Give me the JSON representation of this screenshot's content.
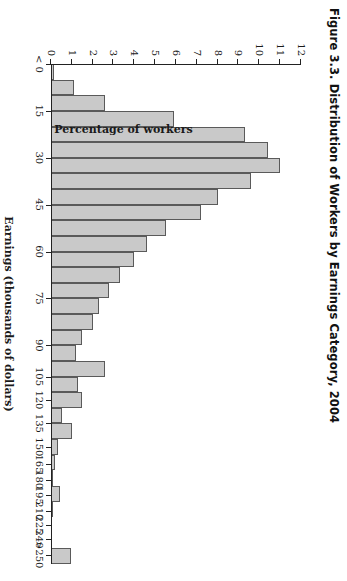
{
  "figure": {
    "title": "Figure 3.3.  Distribution of Workers by Earnings Category, 2004"
  },
  "colors": {
    "bar_fill": "#c9c9c9",
    "bar_stroke": "#5a5a5a",
    "axis": "#222222",
    "background": "#ffffff",
    "text": "#1a1a1a"
  },
  "chart_data": {
    "type": "bar",
    "title": "Figure 3.3.  Distribution of Workers by Earnings Category, 2004",
    "xlabel": "Earnings (thousands of dollars)",
    "ylabel": "Percentage of workers",
    "ylim": [
      0,
      12
    ],
    "ytick_labels": [
      "0",
      "1",
      "2",
      "3",
      "4",
      "5",
      "6",
      "7",
      "8",
      "9",
      "10",
      "11",
      "12"
    ],
    "ytick_values": [
      0,
      1,
      2,
      3,
      4,
      5,
      6,
      7,
      8,
      9,
      10,
      11,
      12
    ],
    "xtick_labels": [
      "< 0",
      "15",
      "30",
      "45",
      "60",
      "75",
      "90",
      "105",
      "120",
      "135",
      "150",
      "165",
      "180",
      "195",
      "210",
      "225",
      "240",
      ">250"
    ],
    "grid": false,
    "legend": null,
    "orientation": "vertical-bars-on-landscape-canvas-rotated-90deg",
    "categories": [
      "< 0",
      "0",
      "5",
      "10",
      "15",
      "20",
      "25",
      "30",
      "35",
      "40",
      "45",
      "50",
      "55",
      "60",
      "65",
      "70",
      "75",
      "80",
      "85",
      "90",
      "95",
      "105",
      "120",
      "135",
      "150",
      "195",
      ">250"
    ],
    "bars": [
      {
        "label": "< 0",
        "x_center": 0,
        "value": 0.15
      },
      {
        "label": "0-5",
        "x_center": 2.5,
        "value": 1.1
      },
      {
        "label": "5-10",
        "x_center": 7.5,
        "value": 2.6
      },
      {
        "label": "10-15",
        "x_center": 12.5,
        "value": 5.9
      },
      {
        "label": "15-20",
        "x_center": 17.5,
        "value": 9.3
      },
      {
        "label": "20-25",
        "x_center": 22.5,
        "value": 10.4
      },
      {
        "label": "25-30",
        "x_center": 27.5,
        "value": 11.0
      },
      {
        "label": "30-35",
        "x_center": 32.5,
        "value": 9.6
      },
      {
        "label": "35-40",
        "x_center": 37.5,
        "value": 8.0
      },
      {
        "label": "40-45",
        "x_center": 42.5,
        "value": 7.2
      },
      {
        "label": "45-50",
        "x_center": 47.5,
        "value": 5.5
      },
      {
        "label": "50-55",
        "x_center": 52.5,
        "value": 4.6
      },
      {
        "label": "55-60",
        "x_center": 57.5,
        "value": 4.0
      },
      {
        "label": "60-65",
        "x_center": 62.5,
        "value": 3.3
      },
      {
        "label": "65-70",
        "x_center": 67.5,
        "value": 2.8
      },
      {
        "label": "70-75",
        "x_center": 72.5,
        "value": 2.3
      },
      {
        "label": "75-80",
        "x_center": 77.5,
        "value": 2.0
      },
      {
        "label": "80-85",
        "x_center": 82.5,
        "value": 1.5
      },
      {
        "label": "85-90",
        "x_center": 87.5,
        "value": 1.2
      },
      {
        "label": "90-95",
        "x_center": 92.5,
        "value": 2.6
      },
      {
        "label": "95-105",
        "x_center": 100,
        "value": 1.3
      },
      {
        "label": "105-120",
        "x_center": 112,
        "value": 1.5
      },
      {
        "label": "120-135",
        "x_center": 127,
        "value": 0.55
      },
      {
        "label": "135-150",
        "x_center": 142,
        "value": 1.0
      },
      {
        "label": "150-165",
        "x_center": 157,
        "value": 0.35
      },
      {
        "label": "165-180",
        "x_center": 172,
        "value": 0.2
      },
      {
        "label": "180-195",
        "x_center": 187,
        "value": 0.1
      },
      {
        "label": "195-210",
        "x_center": 202,
        "value": 0.45
      },
      {
        "label": "210-225",
        "x_center": 217,
        "value": 0.08
      },
      {
        "label": "225-240",
        "x_center": 232,
        "value": 0.06
      },
      {
        "label": "240-250",
        "x_center": 245,
        "value": 0.05
      },
      {
        "label": ">250",
        "x_center": 257,
        "value": 0.95
      }
    ]
  }
}
